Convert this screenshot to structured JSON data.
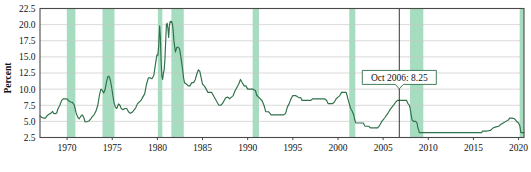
{
  "chart_data": {
    "type": "line",
    "title": "",
    "xlabel": "",
    "ylabel": "Percent",
    "xlim": [
      1967.0,
      2020.6
    ],
    "ylim": [
      2.5,
      22.5
    ],
    "grid": true,
    "legend": null,
    "y_ticks": [
      "2.5",
      "5.0",
      "7.5",
      "10.0",
      "12.5",
      "15.0",
      "17.5",
      "20.0",
      "22.5"
    ],
    "y_tick_values": [
      2.5,
      5.0,
      7.5,
      10.0,
      12.5,
      15.0,
      17.5,
      20.0,
      22.5
    ],
    "x_ticks": [
      "1970",
      "1975",
      "1980",
      "1985",
      "1990",
      "1995",
      "2000",
      "2005",
      "2010",
      "2015",
      "2020"
    ],
    "x_tick_values": [
      1970,
      1975,
      1980,
      1985,
      1990,
      1995,
      2000,
      2005,
      2010,
      2015,
      2020
    ],
    "colors": {
      "line": "#2e7048",
      "recession_band": "#a6dcc0",
      "gridline": "#c9c9c9",
      "frame": "#4a4a4a",
      "marker": "#202020",
      "callout_border": "#2e7048",
      "callout_fill": "#ffffff",
      "background": "#ffffff"
    },
    "annotations": [
      {
        "name": "oct-2006-callout",
        "label": "Oct 2006: 8.25",
        "x": 2006.79,
        "y": 8.25,
        "marker_line": true
      }
    ],
    "recession_bands": [
      {
        "start": 1969.97,
        "end": 1970.92
      },
      {
        "start": 1973.92,
        "end": 1975.25
      },
      {
        "start": 1980.05,
        "end": 1980.55
      },
      {
        "start": 1981.55,
        "end": 1982.92
      },
      {
        "start": 1990.55,
        "end": 1991.25
      },
      {
        "start": 2001.25,
        "end": 2001.92
      },
      {
        "start": 2007.98,
        "end": 2009.45
      },
      {
        "start": 2020.12,
        "end": 2020.6
      }
    ],
    "series": [
      {
        "name": "Bank prime loan rate",
        "color": "#2e7048",
        "points": [
          [
            1967.0,
            5.85
          ],
          [
            1967.2,
            5.6
          ],
          [
            1967.4,
            5.5
          ],
          [
            1967.6,
            5.5
          ],
          [
            1967.8,
            5.9
          ],
          [
            1968.0,
            6.1
          ],
          [
            1968.2,
            6.25
          ],
          [
            1968.4,
            6.55
          ],
          [
            1968.5,
            6.25
          ],
          [
            1968.7,
            6.2
          ],
          [
            1968.85,
            6.3
          ],
          [
            1969.0,
            7.0
          ],
          [
            1969.2,
            7.5
          ],
          [
            1969.4,
            8.25
          ],
          [
            1969.6,
            8.5
          ],
          [
            1969.8,
            8.5
          ],
          [
            1970.0,
            8.5
          ],
          [
            1970.2,
            8.15
          ],
          [
            1970.4,
            8.0
          ],
          [
            1970.6,
            7.95
          ],
          [
            1970.8,
            7.5
          ],
          [
            1971.0,
            6.3
          ],
          [
            1971.2,
            5.6
          ],
          [
            1971.35,
            5.4
          ],
          [
            1971.5,
            5.75
          ],
          [
            1971.7,
            6.0
          ],
          [
            1971.85,
            5.6
          ],
          [
            1972.0,
            4.9
          ],
          [
            1972.2,
            4.95
          ],
          [
            1972.4,
            5.05
          ],
          [
            1972.6,
            5.35
          ],
          [
            1972.8,
            5.75
          ],
          [
            1973.0,
            6.05
          ],
          [
            1973.2,
            6.6
          ],
          [
            1973.4,
            7.5
          ],
          [
            1973.6,
            9.2
          ],
          [
            1973.75,
            10.0
          ],
          [
            1973.9,
            9.8
          ],
          [
            1974.05,
            9.4
          ],
          [
            1974.2,
            9.9
          ],
          [
            1974.35,
            11.0
          ],
          [
            1974.5,
            11.9
          ],
          [
            1974.62,
            12.0
          ],
          [
            1974.75,
            11.6
          ],
          [
            1974.9,
            10.6
          ],
          [
            1975.05,
            9.2
          ],
          [
            1975.2,
            7.9
          ],
          [
            1975.35,
            7.2
          ],
          [
            1975.5,
            7.0
          ],
          [
            1975.7,
            7.7
          ],
          [
            1975.85,
            7.5
          ],
          [
            1976.0,
            7.0
          ],
          [
            1976.2,
            6.8
          ],
          [
            1976.4,
            7.0
          ],
          [
            1976.6,
            7.0
          ],
          [
            1976.8,
            6.5
          ],
          [
            1977.0,
            6.25
          ],
          [
            1977.2,
            6.4
          ],
          [
            1977.4,
            6.75
          ],
          [
            1977.6,
            7.1
          ],
          [
            1977.8,
            7.75
          ],
          [
            1978.0,
            8.0
          ],
          [
            1978.2,
            8.3
          ],
          [
            1978.4,
            8.8
          ],
          [
            1978.6,
            9.3
          ],
          [
            1978.8,
            10.8
          ],
          [
            1979.0,
            11.75
          ],
          [
            1979.2,
            11.75
          ],
          [
            1979.4,
            11.6
          ],
          [
            1979.6,
            12.1
          ],
          [
            1979.8,
            14.0
          ],
          [
            1979.95,
            15.3
          ],
          [
            1980.05,
            15.25
          ],
          [
            1980.15,
            16.8
          ],
          [
            1980.25,
            19.8
          ],
          [
            1980.33,
            18.0
          ],
          [
            1980.42,
            14.0
          ],
          [
            1980.5,
            12.0
          ],
          [
            1980.58,
            11.5
          ],
          [
            1980.67,
            12.5
          ],
          [
            1980.75,
            13.0
          ],
          [
            1980.83,
            14.5
          ],
          [
            1980.92,
            17.5
          ],
          [
            1981.0,
            20.0
          ],
          [
            1981.08,
            20.2
          ],
          [
            1981.17,
            19.4
          ],
          [
            1981.25,
            18.0
          ],
          [
            1981.33,
            19.8
          ],
          [
            1981.42,
            20.5
          ],
          [
            1981.5,
            20.35
          ],
          [
            1981.58,
            20.5
          ],
          [
            1981.67,
            20.05
          ],
          [
            1981.75,
            19.0
          ],
          [
            1981.83,
            17.5
          ],
          [
            1981.92,
            16.5
          ],
          [
            1982.0,
            15.75
          ],
          [
            1982.15,
            16.5
          ],
          [
            1982.3,
            16.5
          ],
          [
            1982.45,
            16.25
          ],
          [
            1982.6,
            15.0
          ],
          [
            1982.75,
            13.5
          ],
          [
            1982.9,
            11.75
          ],
          [
            1983.0,
            11.0
          ],
          [
            1983.2,
            10.8
          ],
          [
            1983.4,
            10.5
          ],
          [
            1983.6,
            10.5
          ],
          [
            1983.8,
            11.0
          ],
          [
            1984.0,
            11.0
          ],
          [
            1984.2,
            11.5
          ],
          [
            1984.4,
            12.5
          ],
          [
            1984.55,
            13.0
          ],
          [
            1984.7,
            12.75
          ],
          [
            1984.85,
            11.75
          ],
          [
            1985.0,
            10.75
          ],
          [
            1985.2,
            10.5
          ],
          [
            1985.4,
            10.0
          ],
          [
            1985.6,
            9.5
          ],
          [
            1985.8,
            9.5
          ],
          [
            1986.0,
            9.5
          ],
          [
            1986.2,
            9.0
          ],
          [
            1986.4,
            8.5
          ],
          [
            1986.6,
            8.0
          ],
          [
            1986.8,
            7.5
          ],
          [
            1987.0,
            7.5
          ],
          [
            1987.2,
            7.75
          ],
          [
            1987.4,
            8.25
          ],
          [
            1987.6,
            8.7
          ],
          [
            1987.8,
            8.75
          ],
          [
            1988.0,
            8.5
          ],
          [
            1988.2,
            8.75
          ],
          [
            1988.4,
            9.0
          ],
          [
            1988.6,
            9.75
          ],
          [
            1988.8,
            10.25
          ],
          [
            1989.0,
            10.75
          ],
          [
            1989.2,
            11.5
          ],
          [
            1989.4,
            11.0
          ],
          [
            1989.6,
            10.5
          ],
          [
            1989.8,
            10.5
          ],
          [
            1990.0,
            10.0
          ],
          [
            1990.3,
            10.0
          ],
          [
            1990.6,
            10.0
          ],
          [
            1990.85,
            9.8
          ],
          [
            1991.0,
            9.05
          ],
          [
            1991.2,
            8.75
          ],
          [
            1991.4,
            8.5
          ],
          [
            1991.6,
            8.2
          ],
          [
            1991.8,
            7.5
          ],
          [
            1992.0,
            6.5
          ],
          [
            1992.3,
            6.5
          ],
          [
            1992.6,
            6.0
          ],
          [
            1993.0,
            6.0
          ],
          [
            1993.5,
            6.0
          ],
          [
            1994.0,
            6.0
          ],
          [
            1994.2,
            6.25
          ],
          [
            1994.4,
            7.25
          ],
          [
            1994.6,
            7.75
          ],
          [
            1994.8,
            8.5
          ],
          [
            1995.0,
            9.0
          ],
          [
            1995.3,
            9.0
          ],
          [
            1995.6,
            8.75
          ],
          [
            1995.9,
            8.65
          ],
          [
            1996.0,
            8.25
          ],
          [
            1996.4,
            8.25
          ],
          [
            1996.8,
            8.25
          ],
          [
            1997.0,
            8.25
          ],
          [
            1997.2,
            8.5
          ],
          [
            1997.6,
            8.5
          ],
          [
            1998.0,
            8.5
          ],
          [
            1998.5,
            8.5
          ],
          [
            1998.75,
            8.25
          ],
          [
            1998.9,
            7.75
          ],
          [
            1999.0,
            7.75
          ],
          [
            1999.4,
            7.75
          ],
          [
            1999.6,
            8.0
          ],
          [
            1999.8,
            8.5
          ],
          [
            2000.0,
            8.75
          ],
          [
            2000.2,
            9.0
          ],
          [
            2000.4,
            9.5
          ],
          [
            2000.6,
            9.5
          ],
          [
            2000.9,
            9.5
          ],
          [
            2001.0,
            9.05
          ],
          [
            2001.1,
            8.5
          ],
          [
            2001.2,
            8.0
          ],
          [
            2001.3,
            7.5
          ],
          [
            2001.4,
            7.0
          ],
          [
            2001.5,
            6.75
          ],
          [
            2001.6,
            6.5
          ],
          [
            2001.75,
            6.0
          ],
          [
            2001.85,
            5.25
          ],
          [
            2001.95,
            4.84
          ],
          [
            2002.0,
            4.75
          ],
          [
            2002.4,
            4.75
          ],
          [
            2002.8,
            4.75
          ],
          [
            2002.95,
            4.35
          ],
          [
            2003.0,
            4.25
          ],
          [
            2003.4,
            4.25
          ],
          [
            2003.5,
            4.1
          ],
          [
            2003.6,
            4.0
          ],
          [
            2004.0,
            4.0
          ],
          [
            2004.4,
            4.0
          ],
          [
            2004.55,
            4.25
          ],
          [
            2004.7,
            4.6
          ],
          [
            2004.85,
            5.0
          ],
          [
            2005.0,
            5.25
          ],
          [
            2005.2,
            5.6
          ],
          [
            2005.4,
            6.0
          ],
          [
            2005.6,
            6.4
          ],
          [
            2005.8,
            6.9
          ],
          [
            2006.0,
            7.25
          ],
          [
            2006.2,
            7.6
          ],
          [
            2006.4,
            8.0
          ],
          [
            2006.6,
            8.25
          ],
          [
            2006.79,
            8.25
          ],
          [
            2007.0,
            8.25
          ],
          [
            2007.3,
            8.25
          ],
          [
            2007.6,
            8.25
          ],
          [
            2007.75,
            7.75
          ],
          [
            2007.9,
            7.5
          ],
          [
            2008.0,
            6.98
          ],
          [
            2008.1,
            6.0
          ],
          [
            2008.2,
            5.25
          ],
          [
            2008.35,
            5.0
          ],
          [
            2008.6,
            5.0
          ],
          [
            2008.75,
            4.75
          ],
          [
            2008.85,
            4.0
          ],
          [
            2008.95,
            3.61
          ],
          [
            2009.0,
            3.25
          ],
          [
            2009.5,
            3.25
          ],
          [
            2010.0,
            3.25
          ],
          [
            2011.0,
            3.25
          ],
          [
            2012.0,
            3.25
          ],
          [
            2013.0,
            3.25
          ],
          [
            2014.0,
            3.25
          ],
          [
            2015.0,
            3.25
          ],
          [
            2015.9,
            3.25
          ],
          [
            2016.0,
            3.5
          ],
          [
            2016.5,
            3.5
          ],
          [
            2016.9,
            3.6
          ],
          [
            2017.0,
            3.75
          ],
          [
            2017.2,
            4.0
          ],
          [
            2017.5,
            4.15
          ],
          [
            2017.8,
            4.25
          ],
          [
            2018.0,
            4.5
          ],
          [
            2018.3,
            4.75
          ],
          [
            2018.6,
            5.0
          ],
          [
            2018.9,
            5.25
          ],
          [
            2019.0,
            5.5
          ],
          [
            2019.3,
            5.5
          ],
          [
            2019.55,
            5.4
          ],
          [
            2019.7,
            5.15
          ],
          [
            2019.85,
            4.9
          ],
          [
            2020.0,
            4.75
          ],
          [
            2020.15,
            4.25
          ],
          [
            2020.25,
            3.25
          ],
          [
            2020.45,
            3.25
          ],
          [
            2020.6,
            3.25
          ]
        ]
      }
    ]
  }
}
